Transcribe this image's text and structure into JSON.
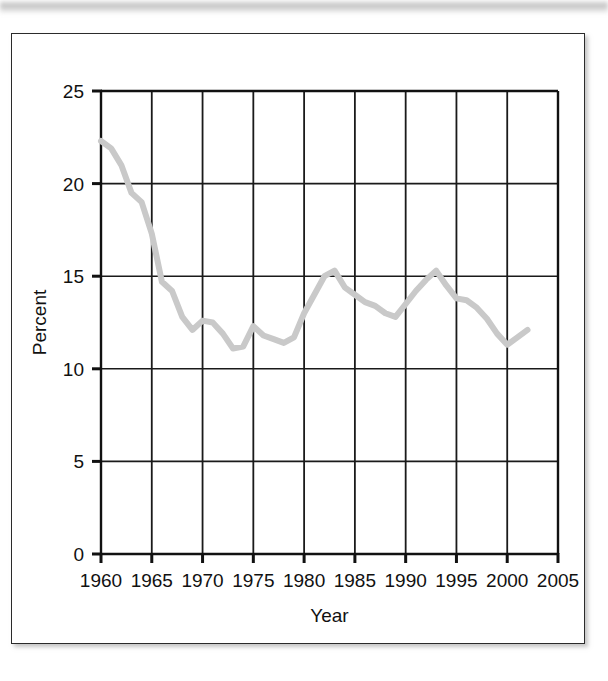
{
  "figure": {
    "frame_border_color": "#2b2b2b",
    "background_color": "#ffffff"
  },
  "chart_data": {
    "type": "line",
    "title": "",
    "subtitle": "",
    "xlabel": "Year",
    "ylabel": "Percent",
    "xlim": [
      1960,
      2005
    ],
    "ylim": [
      0,
      25
    ],
    "xticks": [
      1960,
      1965,
      1970,
      1975,
      1980,
      1985,
      1990,
      1995,
      2000,
      2005
    ],
    "xtick_labels": [
      "1960",
      "1965",
      "1970",
      "1975",
      "1980",
      "1985",
      "1990",
      "1995",
      "2000",
      "2005"
    ],
    "yticks": [
      0,
      5,
      10,
      15,
      20,
      25
    ],
    "ytick_labels": [
      "0",
      "5",
      "10",
      "15",
      "20",
      "25"
    ],
    "grid": "both",
    "legend": "none",
    "line_color": "#c9c9c9",
    "line_width": 6,
    "series": [
      {
        "name": "Percent",
        "x": [
          1960,
          1961,
          1962,
          1963,
          1964,
          1965,
          1966,
          1967,
          1968,
          1969,
          1970,
          1971,
          1972,
          1973,
          1974,
          1975,
          1976,
          1977,
          1978,
          1979,
          1980,
          1981,
          1982,
          1983,
          1984,
          1985,
          1986,
          1987,
          1988,
          1989,
          1990,
          1991,
          1992,
          1993,
          1994,
          1995,
          1996,
          1997,
          1998,
          1999,
          2000,
          2001,
          2002
        ],
        "values": [
          22.3,
          21.9,
          21.0,
          19.5,
          19.0,
          17.3,
          14.7,
          14.2,
          12.8,
          12.1,
          12.6,
          12.5,
          11.9,
          11.1,
          11.2,
          12.3,
          11.8,
          11.6,
          11.4,
          11.7,
          13.0,
          14.0,
          15.0,
          15.3,
          14.4,
          14.0,
          13.6,
          13.4,
          13.0,
          12.8,
          13.5,
          14.2,
          14.8,
          15.3,
          14.5,
          13.8,
          13.7,
          13.3,
          12.7,
          11.9,
          11.3,
          11.7,
          12.1
        ]
      }
    ]
  }
}
